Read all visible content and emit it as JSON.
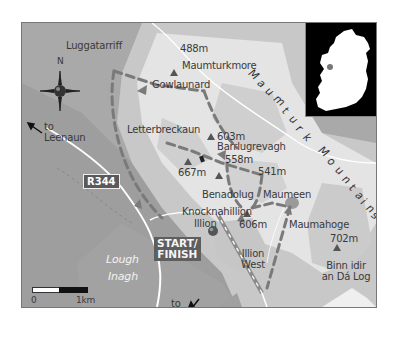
{
  "map": {
    "title": "Maumturk Mountains walk route map",
    "colors": {
      "lowland": "#a9a9a9",
      "midland": "#c8c8c8",
      "highland": "#e6e6e6",
      "peak": "#f4f4f4",
      "route": "#7a7a7a",
      "road": "#ffffff",
      "inset_bg": "#000000",
      "inset_land": "#ffffff",
      "marker": "#555555"
    },
    "places": {
      "luggatarriff": "Luggatarriff",
      "maumturkmore": "Maumturkmore",
      "gowlaunard": "Gowlaunard",
      "letterbreckaun": "Letterbreckaun",
      "barrlugrevagh": "Barrlugrevagh",
      "benadolug": "Benadolug",
      "maumeen": "Maumeen",
      "knocknahillion": "Knocknahillion",
      "illion": "Illion",
      "maumahoge": "Maumahoge",
      "illion_west_1": "Illion",
      "illion_west_2": "West",
      "binn_1": "Binn idir",
      "binn_2": "an Dá Log"
    },
    "peaks": {
      "p488": "488m",
      "p603": "603m",
      "p667": "667m",
      "p558": "558m",
      "p541": "541m",
      "p606": "606m",
      "p702": "702m"
    },
    "mountain_range_label": "Maumturk Mountains",
    "mountain_range_letters": [
      "M",
      "a",
      "u",
      "m",
      "t",
      "u",
      "r",
      "k",
      "M",
      "o",
      "u",
      "n",
      "t",
      "a",
      "i",
      "n",
      "s"
    ],
    "road_badge": "R344",
    "start_finish": [
      "START/",
      "FINISH"
    ],
    "directions": {
      "leenaun_1": "to",
      "leenaun_2": "Leenaun",
      "recess_1": "to",
      "recess_2": "Recess"
    },
    "lake": [
      "Lough",
      "Inagh"
    ],
    "compass": {
      "north_label": "N"
    },
    "scale": {
      "start": "0",
      "end": "1km"
    },
    "inset": {
      "label": "Ireland locator map"
    }
  }
}
